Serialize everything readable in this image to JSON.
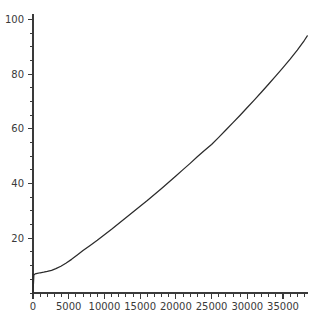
{
  "chart_data": {
    "type": "line",
    "title": "",
    "subtitle": "",
    "xlabel": "",
    "ylabel": "",
    "xlim": [
      0,
      38500
    ],
    "ylim": [
      0,
      102
    ],
    "grid": false,
    "legend": null,
    "line_color": "#2b2b2b",
    "axis_color": "#3a3a3a",
    "background_color": "#ffffff",
    "x_ticks_major": [
      0,
      5000,
      10000,
      15000,
      20000,
      25000,
      30000,
      35000
    ],
    "x_tick_labels": [
      "0",
      "5000",
      "10000",
      "15000",
      "20000",
      "25000",
      "30000",
      "35000"
    ],
    "x_tick_minor_step": 1000,
    "y_ticks_major": [
      20,
      40,
      60,
      80,
      100
    ],
    "y_tick_labels": [
      "20",
      "40",
      "60",
      "80",
      "100"
    ],
    "y_tick_minor_step": 5,
    "series": [
      {
        "name": "cumulative",
        "x": [
          0,
          60,
          120,
          300,
          600,
          1000,
          1500,
          2000,
          2600,
          3200,
          3900,
          4600,
          5400,
          6200,
          7000,
          8000,
          9000,
          10000,
          11000,
          12000,
          13000,
          14000,
          15000,
          16000,
          17000,
          18000,
          19000,
          20000,
          21000,
          22000,
          23000,
          24000,
          25000,
          26000,
          27000,
          28000,
          29000,
          30000,
          31000,
          32000,
          33000,
          34000,
          35000,
          36000,
          37000,
          38000,
          38400
        ],
        "y": [
          0.6,
          3.2,
          6.6,
          7.0,
          7.2,
          7.4,
          7.6,
          7.9,
          8.3,
          8.9,
          9.8,
          10.9,
          12.3,
          13.9,
          15.5,
          17.4,
          19.3,
          21.3,
          23.3,
          25.4,
          27.5,
          29.6,
          31.7,
          33.8,
          36.0,
          38.2,
          40.5,
          42.8,
          45.1,
          47.4,
          49.8,
          52.1,
          54.3,
          56.9,
          59.6,
          62.3,
          65.0,
          67.8,
          70.6,
          73.5,
          76.4,
          79.4,
          82.4,
          85.5,
          88.8,
          92.4,
          94.0
        ]
      }
    ],
    "initial_spike": {
      "description": "near-vertical rise at x=0 from 0 to about 7",
      "x": 0,
      "y_from": 0,
      "y_to": 7.0
    }
  },
  "geometry": {
    "plot_left": 33,
    "plot_right": 308,
    "plot_top": 14,
    "plot_bottom": 293
  }
}
